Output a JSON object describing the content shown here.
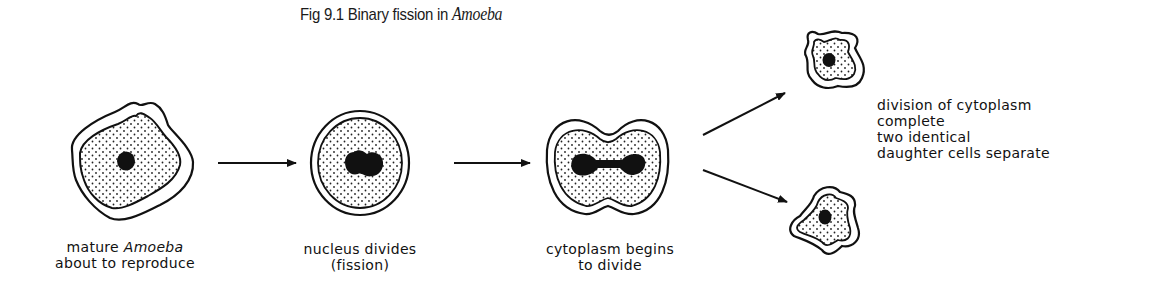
{
  "figure": {
    "title_prefix": "Fig 9.1  Binary fission in ",
    "title_italic": "Amoeba"
  },
  "stages": [
    {
      "id": "mature",
      "line1_a": "mature ",
      "line1_italic": "Amoeba",
      "line2": "about to reproduce"
    },
    {
      "id": "nucleus-divides",
      "line1": "nucleus divides",
      "line2": "(fission)"
    },
    {
      "id": "cytoplasm-begins",
      "line1": "cytoplasm begins",
      "line2": "to divide"
    },
    {
      "id": "division-complete",
      "lines": [
        "division of cytoplasm",
        "complete",
        "two identical",
        "daughter cells separate"
      ]
    }
  ],
  "colors": {
    "ink": "#111111",
    "background": "#ffffff"
  }
}
